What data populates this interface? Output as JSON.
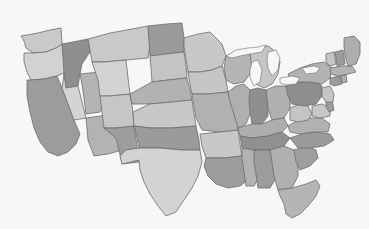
{
  "map": {
    "title": "United States Choropleth Map",
    "region": "Contiguous United States",
    "projection": "albers-usa",
    "background_color": "#f7f7f7",
    "border_color": "#6d6d6d",
    "border_width": 0.8,
    "width": 369,
    "height": 229,
    "legend_visible": false,
    "labels_visible": false,
    "palette": {
      "light": "#c9c9c9",
      "mid": "#b0b0b0",
      "dark": "#9a9a9a",
      "darker": "#8e8e8e",
      "lightest": "#d6d6d6"
    },
    "ghost_marks": [
      {
        "text": "",
        "x": 8,
        "y": 186
      },
      {
        "text": "",
        "x": 250,
        "y": 188
      }
    ],
    "states": [
      {
        "code": "WA",
        "name": "Washington",
        "shade": "light",
        "fill": "#c9c9c9",
        "points": "21,36 38,33 50,30 61,28 62,44 56,48 46,52 33,53 26,48 24,41"
      },
      {
        "code": "OR",
        "name": "Oregon",
        "shade": "lightest",
        "fill": "#d2d2d2",
        "points": "24,53 33,53 46,52 56,48 62,44 64,58 66,72 57,76 44,79 31,80 27,72 24,62"
      },
      {
        "code": "CA",
        "name": "California",
        "shade": "dark",
        "fill": "#9c9c9c",
        "points": "27,80 31,80 44,79 57,76 62,88 68,104 74,120 80,134 76,144 68,152 58,156 48,152 40,142 34,128 30,112 27,96"
      },
      {
        "code": "ID",
        "name": "Idaho",
        "shade": "darker",
        "fill": "#8f8f8f",
        "points": "62,44 78,41 88,39 90,52 86,58 82,64 80,74 78,86 66,88 64,74 63,58"
      },
      {
        "code": "NV",
        "name": "Nevada",
        "shade": "lightest",
        "fill": "#d4d4d4",
        "points": "64,74 66,88 78,86 86,118 74,120 68,104 62,88"
      },
      {
        "code": "UT",
        "name": "Utah",
        "shade": "mid",
        "fill": "#b4b4b4",
        "points": "80,74 100,72 103,88 104,104 100,112 86,114 84,98 82,84"
      },
      {
        "code": "AZ",
        "name": "Arizona",
        "shade": "mid",
        "fill": "#b3b3b3",
        "points": "86,118 100,116 116,114 119,132 122,150 108,154 94,156 88,140"
      },
      {
        "code": "MT",
        "name": "Montana",
        "shade": "light",
        "fill": "#c9c9c9",
        "points": "88,39 110,33 132,29 148,26 150,44 148,58 126,60 104,62 92,62 90,50"
      },
      {
        "code": "WY",
        "name": "Wyoming",
        "shade": "lightest",
        "fill": "#d2d2d2",
        "points": "92,62 104,62 126,60 128,78 130,94 110,96 100,96 98,80"
      },
      {
        "code": "CO",
        "name": "Colorado",
        "shade": "light",
        "fill": "#c6c6c6",
        "points": "100,96 110,96 130,94 133,112 134,126 116,128 104,128 102,112"
      },
      {
        "code": "NM",
        "name": "New Mexico",
        "shade": "dark",
        "fill": "#9d9d9d",
        "points": "104,128 116,128 134,126 137,146 139,162 122,164 119,150 116,138"
      },
      {
        "code": "ND",
        "name": "North Dakota",
        "shade": "dark",
        "fill": "#9a9a9a",
        "points": "148,26 166,24 182,23 184,38 184,52 166,54 150,56 149,42"
      },
      {
        "code": "SD",
        "name": "South Dakota",
        "shade": "light",
        "fill": "#c4c4c4",
        "points": "150,56 166,54 184,52 186,66 187,78 168,80 152,82 151,68"
      },
      {
        "code": "NE",
        "name": "Nebraska",
        "shade": "mid",
        "fill": "#b2b2b2",
        "points": "130,94 152,82 168,80 187,78 190,90 192,100 172,102 150,104 132,104"
      },
      {
        "code": "KS",
        "name": "Kansas",
        "shade": "light",
        "fill": "#c8c8c8",
        "points": "133,112 150,104 172,102 192,100 194,114 196,126 172,128 150,128 134,126"
      },
      {
        "code": "OK",
        "name": "Oklahoma",
        "shade": "dark",
        "fill": "#9b9b9b",
        "points": "134,126 150,128 172,128 196,126 199,140 200,150 182,150 160,148 139,148 137,138"
      },
      {
        "code": "TX",
        "name": "Texas",
        "shade": "lightest",
        "fill": "#d3d3d3",
        "points": "139,148 160,148 182,150 200,150 202,162 198,176 192,188 184,200 176,212 166,216 158,206 150,194 144,182 140,170 139,160 122,164 120,156 126,150"
      },
      {
        "code": "MN",
        "name": "Minnesota",
        "shade": "light",
        "fill": "#c8c8c8",
        "points": "184,38 198,34 210,32 216,38 222,44 226,56 222,66 212,70 200,72 188,72 186,58 184,46"
      },
      {
        "code": "IA",
        "name": "Iowa",
        "shade": "light",
        "fill": "#c5c5c5",
        "points": "188,72 200,72 212,70 222,66 226,80 228,92 208,94 192,94 190,84"
      },
      {
        "code": "MO",
        "name": "Missouri",
        "shade": "mid",
        "fill": "#b1b1b1",
        "points": "192,94 208,94 228,92 232,104 236,116 238,130 220,132 202,130 196,118 194,106"
      },
      {
        "code": "AR",
        "name": "Arkansas",
        "shade": "light",
        "fill": "#c7c7c7",
        "points": "200,134 220,132 238,130 240,144 242,156 224,158 206,158 202,146"
      },
      {
        "code": "LA",
        "name": "Louisiana",
        "shade": "dark",
        "fill": "#9d9d9d",
        "points": "206,158 224,158 242,156 246,168 248,180 240,186 228,188 216,184 208,176 204,166"
      },
      {
        "code": "WI",
        "name": "Wisconsin",
        "shade": "mid",
        "fill": "#b5b5b5",
        "points": "226,56 234,52 242,50 250,54 252,64 250,74 244,82 234,84 226,80 224,68"
      },
      {
        "code": "IL",
        "name": "Illinois",
        "shade": "mid",
        "fill": "#afafaf",
        "points": "228,92 236,86 244,84 250,90 252,102 250,114 246,124 238,128 234,114 230,102"
      },
      {
        "code": "MI",
        "name": "Michigan",
        "shade": "light",
        "fill": "#c6c6c6",
        "points": "250,54 258,48 268,46 276,52 280,62 278,74 272,84 264,88 256,84 252,72 251,62"
      },
      {
        "code": "IN",
        "name": "Indiana",
        "shade": "darker",
        "fill": "#8f8f8f",
        "points": "250,90 258,88 266,90 268,102 268,116 262,124 252,124 250,112 249,100"
      },
      {
        "code": "OH",
        "name": "Ohio",
        "shade": "mid",
        "fill": "#b0b0b0",
        "points": "266,90 276,86 286,86 290,96 290,108 284,118 272,120 268,108 267,98"
      },
      {
        "code": "KY",
        "name": "Kentucky",
        "shade": "mid",
        "fill": "#aeaeae",
        "points": "238,128 252,124 262,124 272,120 284,118 288,126 282,132 268,136 252,138 240,136"
      },
      {
        "code": "TN",
        "name": "Tennessee",
        "shade": "darker",
        "fill": "#909090",
        "points": "240,136 252,138 268,136 282,132 290,138 284,146 270,150 254,150 242,148"
      },
      {
        "code": "MS",
        "name": "Mississippi",
        "shade": "mid",
        "fill": "#b2b2b2",
        "points": "242,148 254,150 258,162 260,176 254,186 246,186 244,172 242,158"
      },
      {
        "code": "AL",
        "name": "Alabama",
        "shade": "dark",
        "fill": "#9c9c9c",
        "points": "254,150 270,150 274,164 276,178 270,188 258,188 256,174 254,162"
      },
      {
        "code": "GA",
        "name": "Georgia",
        "shade": "mid",
        "fill": "#b0b0b0",
        "points": "270,150 284,146 294,150 298,162 298,176 292,188 278,190 274,176 272,162"
      },
      {
        "code": "FL",
        "name": "Florida",
        "shade": "mid",
        "fill": "#b4b4b4",
        "points": "278,190 292,188 306,184 316,180 320,186 316,196 308,206 300,214 292,218 286,214 284,204 280,196"
      },
      {
        "code": "SC",
        "name": "South Carolina",
        "shade": "dark",
        "fill": "#9e9e9e",
        "points": "294,150 306,146 316,150 318,158 310,166 300,170 296,162"
      },
      {
        "code": "NC",
        "name": "North Carolina",
        "shade": "dark",
        "fill": "#9b9b9b",
        "points": "290,138 302,134 316,132 330,134 334,140 324,146 310,148 298,148"
      },
      {
        "code": "VA",
        "name": "Virginia",
        "shade": "mid",
        "fill": "#b1b1b1",
        "points": "288,126 298,120 310,118 322,118 330,124 328,132 314,132 300,134 290,132"
      },
      {
        "code": "WV",
        "name": "West Virginia",
        "shade": "light",
        "fill": "#c4c4c4",
        "points": "290,108 300,104 308,106 312,114 308,120 298,122 290,120"
      },
      {
        "code": "PA",
        "name": "Pennsylvania",
        "shade": "darker",
        "fill": "#8e8e8e",
        "points": "286,86 300,82 314,80 322,86 322,96 316,104 304,106 292,104 288,96"
      },
      {
        "code": "NY",
        "name": "New York",
        "shade": "mid",
        "fill": "#b2b2b2",
        "points": "288,74 300,68 312,64 324,62 332,68 330,78 322,84 310,82 296,82 290,80"
      },
      {
        "code": "MD",
        "name": "Maryland",
        "shade": "light",
        "fill": "#c7c7c7",
        "points": "312,106 322,104 330,108 330,116 320,118 312,116"
      },
      {
        "code": "DE",
        "name": "Delaware",
        "shade": "dark",
        "fill": "#9d9d9d",
        "points": "326,100 332,100 334,110 329,112 326,106"
      },
      {
        "code": "NJ",
        "name": "New Jersey",
        "shade": "light",
        "fill": "#c6c6c6",
        "points": "322,88 330,86 334,94 333,102 326,102 322,96"
      },
      {
        "code": "CT",
        "name": "Connecticut",
        "shade": "dark",
        "fill": "#9b9b9b",
        "points": "330,78 340,76 342,84 334,86 330,84"
      },
      {
        "code": "RI",
        "name": "Rhode Island",
        "shade": "mid",
        "fill": "#b0b0b0",
        "points": "341,76 346,75 347,82 342,83"
      },
      {
        "code": "MA",
        "name": "Massachusetts",
        "shade": "mid",
        "fill": "#b3b3b3",
        "points": "330,68 342,66 352,66 356,72 348,74 338,76 331,74"
      },
      {
        "code": "VT",
        "name": "Vermont",
        "shade": "light",
        "fill": "#c5c5c5",
        "points": "326,54 334,52 336,64 330,66 326,62"
      },
      {
        "code": "NH",
        "name": "New Hampshire",
        "shade": "dark",
        "fill": "#9c9c9c",
        "points": "335,52 343,50 345,64 337,66 336,58"
      },
      {
        "code": "ME",
        "name": "Maine",
        "shade": "mid",
        "fill": "#adadad",
        "points": "344,38 354,36 360,42 360,54 356,64 348,66 345,56 344,46"
      }
    ],
    "lakes": [
      {
        "name": "Lake Superior",
        "fill": "#f7f7f7",
        "points": "226,56 236,50 248,48 258,47 266,45 262,52 250,54 240,56 232,58"
      },
      {
        "name": "Lake Michigan",
        "fill": "#f7f7f7",
        "points": "252,62 258,60 262,70 260,82 254,86 250,78 250,70"
      },
      {
        "name": "Lake Huron",
        "fill": "#f7f7f7",
        "points": "268,52 276,50 280,58 278,70 272,76 268,68 267,60"
      },
      {
        "name": "Lake Erie",
        "fill": "#f7f7f7",
        "points": "280,78 292,76 300,78 296,84 286,85 280,83"
      },
      {
        "name": "Lake Ontario",
        "fill": "#f7f7f7",
        "points": "302,68 314,66 320,68 316,73 306,74"
      }
    ]
  }
}
